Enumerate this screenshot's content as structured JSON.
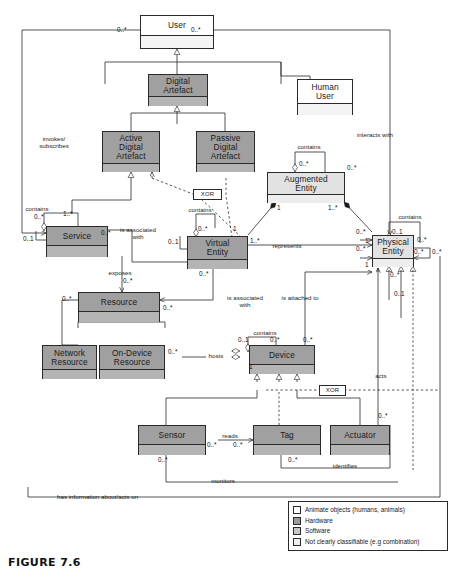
{
  "figure": {
    "caption": "FIGURE 7.6"
  },
  "classes": [
    {
      "id": "user",
      "name": "User",
      "fill": "white"
    },
    {
      "id": "digital-artefact",
      "name": "Digital\nArtefact",
      "fill": "dark"
    },
    {
      "id": "human-user",
      "name": "Human\nUser",
      "fill": "white"
    },
    {
      "id": "active-digital-artefact",
      "name": "Active\nDigital\nArtefact",
      "fill": "dark"
    },
    {
      "id": "passive-digital-artefact",
      "name": "Passive\nDigital\nArtefact",
      "fill": "dark"
    },
    {
      "id": "augmented-entity",
      "name": "Augmented\nEntity",
      "fill": "light"
    },
    {
      "id": "service",
      "name": "Service",
      "fill": "dark"
    },
    {
      "id": "virtual-entity",
      "name": "Virtual\nEntity",
      "fill": "dark"
    },
    {
      "id": "physical-entity",
      "name": "Physical\nEntity",
      "fill": "light"
    },
    {
      "id": "resource",
      "name": "Resource",
      "fill": "dark"
    },
    {
      "id": "network-resource",
      "name": "Network\nResource",
      "fill": "dark"
    },
    {
      "id": "on-device-resource",
      "name": "On-Device\nResource",
      "fill": "dark"
    },
    {
      "id": "device",
      "name": "Device",
      "fill": "dark"
    },
    {
      "id": "sensor",
      "name": "Sensor",
      "fill": "dark"
    },
    {
      "id": "tag",
      "name": "Tag",
      "fill": "dark"
    },
    {
      "id": "actuator",
      "name": "Actuator",
      "fill": "dark"
    }
  ],
  "notes": [
    {
      "id": "xor-artefact",
      "text": "XOR"
    },
    {
      "id": "xor-device",
      "text": "XOR"
    }
  ],
  "association_labels": [
    {
      "id": "invokes-subscribes",
      "text": "invokes/\nsubscribes"
    },
    {
      "id": "interacts-with",
      "text": "interacts with"
    },
    {
      "id": "contains-augmented",
      "text": "contains"
    },
    {
      "id": "contains-service",
      "text": "contains"
    },
    {
      "id": "contains-virtual",
      "text": "contains"
    },
    {
      "id": "contains-physical",
      "text": "contains"
    },
    {
      "id": "contains-device",
      "text": "contains"
    },
    {
      "id": "is-associated-with-service",
      "text": "is associated\nwith"
    },
    {
      "id": "is-associated-with-resource",
      "text": "is associated\nwith"
    },
    {
      "id": "represents",
      "text": "represents"
    },
    {
      "id": "exposes",
      "text": "exposes"
    },
    {
      "id": "is-attached-to",
      "text": "is attached to"
    },
    {
      "id": "hosts",
      "text": "hosts"
    },
    {
      "id": "acts",
      "text": "acts"
    },
    {
      "id": "reads",
      "text": "reads"
    },
    {
      "id": "identifies",
      "text": "identifies"
    },
    {
      "id": "monitors",
      "text": "monitors"
    },
    {
      "id": "has-information-about",
      "text": "has information about/acts on"
    }
  ],
  "multiplicities": [
    {
      "id": "m-user-left",
      "text": "0..*"
    },
    {
      "id": "m-user-right",
      "text": "0..*"
    },
    {
      "id": "m-aug-contains-a",
      "text": "0..*"
    },
    {
      "id": "m-aug-contains-b",
      "text": "0..*"
    },
    {
      "id": "m-aug-ve",
      "text": "1"
    },
    {
      "id": "m-aug-pe",
      "text": "1..*"
    },
    {
      "id": "m-svc-contains-a",
      "text": "0..*"
    },
    {
      "id": "m-svc-contains-b",
      "text": "0..1"
    },
    {
      "id": "m-svc-user",
      "text": "1..*"
    },
    {
      "id": "m-svc-ve",
      "text": "0..*"
    },
    {
      "id": "m-ve-contains-a",
      "text": "0..*"
    },
    {
      "id": "m-ve-contains-b",
      "text": "0..1"
    },
    {
      "id": "m-ve-aug",
      "text": "1"
    },
    {
      "id": "m-ve-represents",
      "text": "1..*"
    },
    {
      "id": "m-ve-resource",
      "text": "0..*"
    },
    {
      "id": "m-pe-contains-a",
      "text": "0..1"
    },
    {
      "id": "m-pe-contains-b",
      "text": "0..*"
    },
    {
      "id": "m-pe-interacts",
      "text": "0..*"
    },
    {
      "id": "m-pe-aug",
      "text": "1"
    },
    {
      "id": "m-pe-represents",
      "text": "0..*"
    },
    {
      "id": "m-pe-attached",
      "text": "1"
    },
    {
      "id": "m-pe-right-a",
      "text": "0..*"
    },
    {
      "id": "m-pe-right-b",
      "text": "0..*"
    },
    {
      "id": "m-pe-below-a",
      "text": "0..*"
    },
    {
      "id": "m-pe-below-b",
      "text": "0..1"
    },
    {
      "id": "m-res-left",
      "text": "0..*"
    },
    {
      "id": "m-res-right",
      "text": "0..*"
    },
    {
      "id": "m-res-exposes",
      "text": "0..*"
    },
    {
      "id": "m-ondev-hosts",
      "text": "0..*"
    },
    {
      "id": "m-dev-contains-a",
      "text": "0..1"
    },
    {
      "id": "m-dev-contains-b",
      "text": "0..*"
    },
    {
      "id": "m-dev-attached",
      "text": "0..*"
    },
    {
      "id": "m-dev-hosts",
      "text": "1"
    },
    {
      "id": "m-sensor-reads",
      "text": "0..*"
    },
    {
      "id": "m-tag-reads",
      "text": "0..*"
    },
    {
      "id": "m-sensor-monitors",
      "text": "0..*"
    },
    {
      "id": "m-tag-identifies",
      "text": "0..*"
    },
    {
      "id": "m-act-acts",
      "text": "0..*"
    }
  ],
  "legend": {
    "items": [
      {
        "swatch": "white",
        "label": "Animate objects (humans, animals)"
      },
      {
        "swatch": "dark",
        "label": "Hardware"
      },
      {
        "swatch": "soft",
        "label": "Software"
      },
      {
        "swatch": "light",
        "label": "Not clearly classifiable (e.g combination)"
      }
    ]
  },
  "colors": {
    "line": "#2a2a2a",
    "fill_white": "#ffffff",
    "fill_light": "#e2e2e2",
    "fill_soft": "#c9c9c9",
    "fill_dark": "#a0a0a0"
  }
}
